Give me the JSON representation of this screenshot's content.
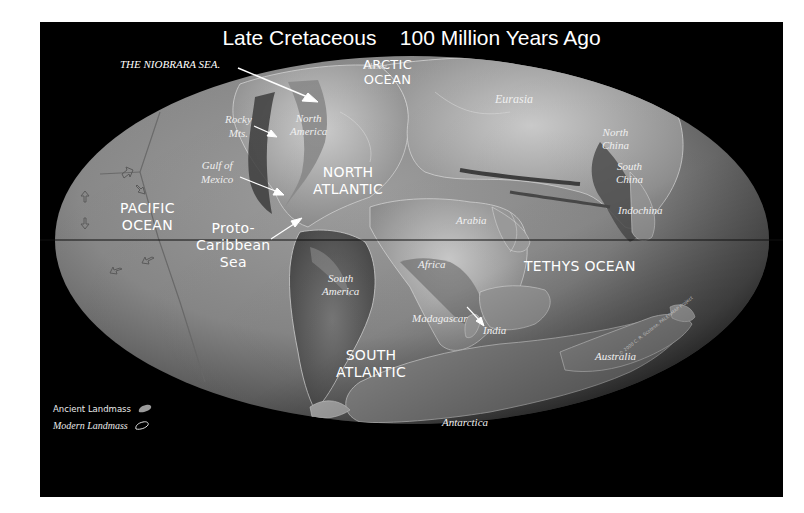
{
  "map": {
    "title": "Late Cretaceous    100 Million Years Ago",
    "era": "Late Cretaceous",
    "age": "100 Million Years Ago",
    "projection": "equal-area ellipse (Mollweide-style)",
    "colors": {
      "background": "#000000",
      "ocean": "#8e8e8e",
      "ancient_land": "#a8a8a8",
      "modern_outline": "#dddddd",
      "equator": "#111111",
      "label": "#ffffff",
      "page": "#ffffff"
    },
    "oceans": {
      "arctic": [
        "ARCTIC",
        "OCEAN"
      ],
      "pacific": [
        "PACIFIC",
        "OCEAN"
      ],
      "proto_caribbean": [
        "Proto-",
        "Caribbean",
        "Sea"
      ],
      "north_atlantic": [
        "NORTH",
        "ATLANTIC"
      ],
      "south_atlantic": [
        "SOUTH",
        "ATLANTIC"
      ],
      "tethys": "TETHYS OCEAN"
    },
    "landmasses": {
      "alaska": "Alaska",
      "north_america": [
        "North",
        "America"
      ],
      "eurasia": "Eurasia",
      "north_china": [
        "North",
        "China"
      ],
      "south_china": [
        "South",
        "China"
      ],
      "indochina": "Indochina",
      "arabia": "Arabia",
      "africa": "Africa",
      "south_america": [
        "South",
        "America"
      ],
      "madagascar": "Madagascar",
      "india": "India",
      "australia": "Australia",
      "antarctica": "Antarctica"
    },
    "callouts": {
      "niobrara": "THE NIOBRARA SEA.",
      "rocky": [
        "Rocky",
        "Mts."
      ],
      "gulf": [
        "Gulf of",
        "Mexico"
      ]
    },
    "legend": {
      "ancient": "Ancient Landmass",
      "modern": "Modern Landmass"
    },
    "copyright": "© 2000  C. R. Scotese, PALEOMAP Project"
  }
}
